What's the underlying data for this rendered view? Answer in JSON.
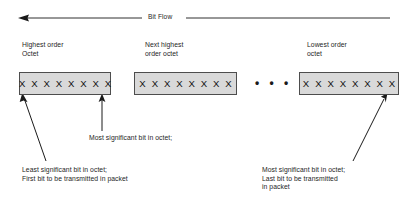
{
  "diagram": {
    "title": "Bit Flow",
    "bit_flow": {
      "label": "Bit Flow",
      "direction": "right-to-left",
      "arrow_icon": "left-arrow-icon"
    },
    "octets": [
      {
        "id": "highest-order-octet",
        "heading": "Highest order\nOctet",
        "bits": "X X X X X X X X"
      },
      {
        "id": "next-highest-order-octet",
        "heading": "Next highest\norder octet",
        "bits": "X X X X X X X X"
      },
      {
        "id": "lowest-order-octet",
        "heading": "Lowest order\noctet",
        "bits": "X X X X X X X X"
      }
    ],
    "ellipsis": "• • •",
    "annotations": [
      {
        "id": "msb-first-octet",
        "text": "Most significant bit in octet;"
      },
      {
        "id": "lsb-first-octet",
        "text": "Least significant bit in octet;\nFirst bit to be transmitted in packet"
      },
      {
        "id": "msb-last-octet",
        "text": "Most significant bit in octet;\nLast bit to be transmitted\nin packet"
      }
    ],
    "colors": {
      "box_fill": "#d9d9d9",
      "box_border": "#4d4d4d",
      "line": "#1a1a1a",
      "text": "#262626",
      "background": "#ffffff"
    }
  }
}
